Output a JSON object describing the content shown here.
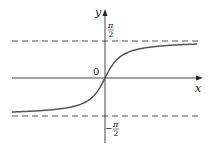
{
  "chart_data": {
    "type": "line",
    "title": "",
    "function": "y = arctan(x)",
    "xlabel": "x",
    "ylabel": "y",
    "origin_label": "0",
    "asymptotes": [
      {
        "y_label": "π/2",
        "value": 1.5708,
        "style": "dashed"
      },
      {
        "y_label": "-π/2",
        "value": -1.5708,
        "style": "dashed"
      }
    ],
    "tick_labels": {
      "upper": {
        "num": "π",
        "den": "2",
        "sign": ""
      },
      "lower": {
        "num": "π",
        "den": "2",
        "sign": "−"
      }
    },
    "x_range": [
      -7.5,
      7.5
    ],
    "ylim": [
      -2.5,
      2.5
    ],
    "grid": false,
    "legend": "none",
    "series": [
      {
        "name": "arctan",
        "x": [
          -7,
          -5,
          -3,
          -2,
          -1,
          -0.5,
          0,
          0.5,
          1,
          2,
          3,
          5,
          7
        ],
        "values": [
          -1.429,
          -1.373,
          -1.249,
          -1.107,
          -0.785,
          -0.464,
          0,
          0.464,
          0.785,
          1.107,
          1.249,
          1.373,
          1.429
        ]
      }
    ],
    "colors": {
      "curve": "#555555",
      "axes": "#333333",
      "asymptote": "#555555"
    }
  }
}
